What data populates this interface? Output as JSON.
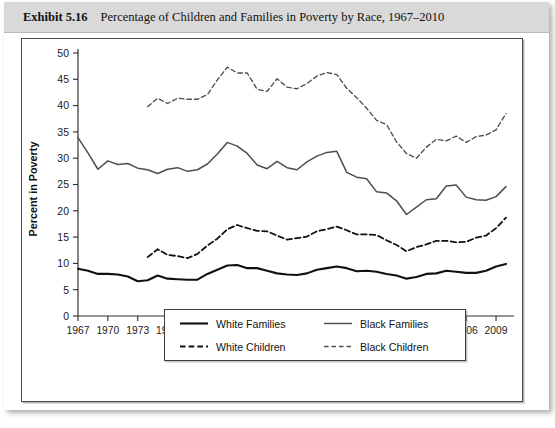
{
  "header": {
    "exhibit_number": "Exhibit 5.16",
    "title": "Percentage of Children and Families in Poverty by Race, 1967–2010"
  },
  "legend": {
    "items": [
      {
        "label": "White Families",
        "style": "solid",
        "color": "#111111"
      },
      {
        "label": "Black Families",
        "style": "solid",
        "color": "#4e4e4e"
      },
      {
        "label": "White Children",
        "style": "dashed",
        "color": "#111111"
      },
      {
        "label": "Black Children",
        "style": "dashed",
        "color": "#4e4e4e"
      }
    ]
  },
  "chart_data": {
    "type": "line",
    "title": "Percentage of Children and Families in Poverty by Race, 1967–2010",
    "xlabel": "",
    "ylabel": "Percent in Poverty",
    "xlim": [
      1967,
      2010
    ],
    "ylim": [
      0,
      50
    ],
    "ytick_step": 5,
    "yticks": [
      0,
      5,
      10,
      15,
      20,
      25,
      30,
      35,
      40,
      45,
      50
    ],
    "xticks": [
      1967,
      1970,
      1973,
      1976,
      1979,
      1982,
      1985,
      1988,
      1991,
      1994,
      1997,
      2000,
      2003,
      2006,
      2009
    ],
    "grid": false,
    "legend_position": "bottom-center",
    "x": [
      1967,
      1968,
      1969,
      1970,
      1971,
      1972,
      1973,
      1974,
      1975,
      1976,
      1977,
      1978,
      1979,
      1980,
      1981,
      1982,
      1983,
      1984,
      1985,
      1986,
      1987,
      1988,
      1989,
      1990,
      1991,
      1992,
      1993,
      1994,
      1995,
      1996,
      1997,
      1998,
      1999,
      2000,
      2001,
      2002,
      2003,
      2004,
      2005,
      2006,
      2007,
      2008,
      2009,
      2010
    ],
    "series": [
      {
        "name": "White Families",
        "style": "solid",
        "color": "#111111",
        "values": [
          9.0,
          8.6,
          8.0,
          8.0,
          7.9,
          7.5,
          6.6,
          6.8,
          7.7,
          7.1,
          7.0,
          6.9,
          6.9,
          8.0,
          8.8,
          9.6,
          9.7,
          9.1,
          9.1,
          8.6,
          8.1,
          7.9,
          7.8,
          8.1,
          8.8,
          9.1,
          9.4,
          9.1,
          8.5,
          8.6,
          8.4,
          8.0,
          7.7,
          7.1,
          7.4,
          8.0,
          8.1,
          8.6,
          8.4,
          8.2,
          8.2,
          8.6,
          9.4,
          9.9
        ]
      },
      {
        "name": "Black Families",
        "style": "solid",
        "color": "#4e4e4e",
        "values": [
          33.9,
          31.0,
          27.9,
          29.5,
          28.8,
          29.0,
          28.1,
          27.8,
          27.1,
          27.9,
          28.2,
          27.5,
          27.8,
          28.9,
          30.8,
          33.0,
          32.3,
          30.9,
          28.7,
          28.0,
          29.4,
          28.2,
          27.8,
          29.3,
          30.4,
          31.1,
          31.3,
          27.3,
          26.4,
          26.1,
          23.6,
          23.4,
          21.9,
          19.3,
          20.7,
          22.1,
          22.3,
          24.7,
          24.9,
          22.6,
          22.1,
          22.0,
          22.7,
          24.6
        ]
      },
      {
        "name": "White Children",
        "style": "dashed",
        "color": "#111111",
        "values": [
          null,
          null,
          null,
          null,
          null,
          null,
          null,
          11.2,
          12.7,
          11.6,
          11.4,
          11.0,
          11.8,
          13.4,
          14.7,
          16.5,
          17.3,
          16.7,
          16.2,
          16.1,
          15.3,
          14.5,
          14.8,
          15.1,
          16.1,
          16.5,
          17.0,
          16.3,
          15.5,
          15.5,
          15.4,
          14.4,
          13.5,
          12.3,
          13.1,
          13.6,
          14.3,
          14.3,
          14.0,
          14.1,
          14.9,
          15.3,
          16.7,
          18.7
        ]
      },
      {
        "name": "Black Children",
        "style": "dashed",
        "color": "#4e4e4e",
        "values": [
          null,
          null,
          null,
          null,
          null,
          null,
          null,
          39.8,
          41.4,
          40.4,
          41.4,
          41.2,
          41.2,
          42.1,
          44.9,
          47.3,
          46.2,
          46.2,
          43.1,
          42.7,
          45.1,
          43.5,
          43.2,
          44.2,
          45.6,
          46.3,
          45.9,
          43.3,
          41.5,
          39.5,
          37.2,
          36.4,
          33.1,
          30.9,
          30.0,
          32.1,
          33.6,
          33.3,
          34.2,
          33.0,
          34.1,
          34.4,
          35.4,
          38.5
        ]
      }
    ]
  }
}
